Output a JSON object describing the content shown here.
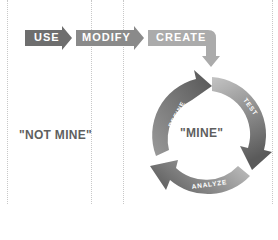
{
  "stages": {
    "use": "USE",
    "modify": "MODIFY",
    "create": "CREATE"
  },
  "zones": {
    "not_mine": "\"NOT MINE\"",
    "mine": "\"MINE\""
  },
  "cycle": {
    "refine": "REFINE",
    "test": "TEST",
    "analyze": "ANALYZE"
  },
  "colors": {
    "use": "#6e6e6e",
    "modify": "#8a8a8a",
    "create": "#ababab",
    "cycle_dark": "#555555",
    "cycle_light": "#bdbdbd",
    "text": "#5f5f5f"
  }
}
